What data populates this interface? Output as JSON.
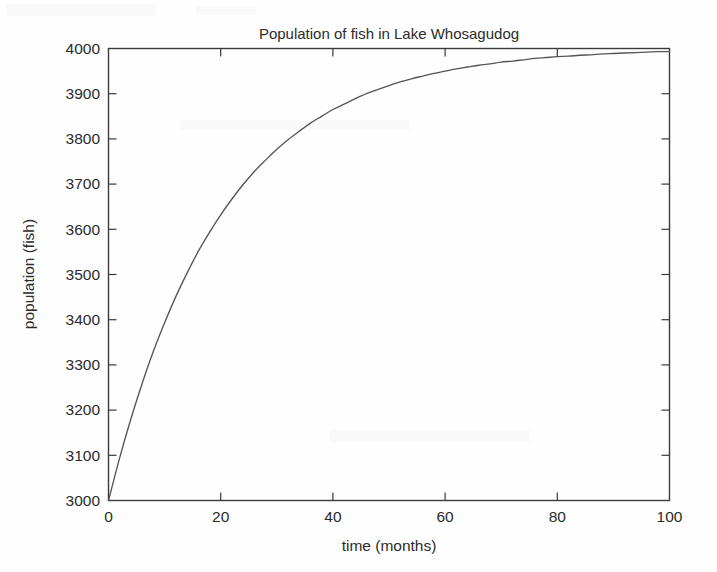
{
  "chart_data": {
    "type": "line",
    "title": "Population of fish in Lake Whosagudog",
    "xlabel": "time (months)",
    "ylabel": "population (fish)",
    "xlim": [
      0,
      100
    ],
    "ylim": [
      3000,
      4000
    ],
    "xticks": [
      0,
      20,
      40,
      60,
      80,
      100
    ],
    "xtick_labels": [
      "0",
      "20",
      "40",
      "60",
      "80",
      "100"
    ],
    "yticks": [
      3000,
      3100,
      3200,
      3300,
      3400,
      3500,
      3600,
      3700,
      3800,
      3900,
      4000
    ],
    "ytick_labels": [
      "3000",
      "3100",
      "3200",
      "3300",
      "3400",
      "3500",
      "3600",
      "3700",
      "3800",
      "3900",
      "4000"
    ],
    "grid": false,
    "legend": null,
    "series": [
      {
        "name": "population",
        "color": "#555555",
        "x": [
          0,
          2,
          4,
          6,
          8,
          10,
          12,
          14,
          16,
          18,
          20,
          22,
          24,
          26,
          28,
          30,
          32,
          34,
          36,
          38,
          40,
          42,
          44,
          46,
          48,
          50,
          52,
          54,
          56,
          58,
          60,
          62,
          64,
          66,
          68,
          70,
          72,
          74,
          76,
          78,
          80,
          82,
          84,
          86,
          88,
          90,
          92,
          94,
          96,
          98,
          100
        ],
        "values": [
          3000,
          3095,
          3181,
          3259,
          3330,
          3393,
          3451,
          3503,
          3551,
          3593,
          3632,
          3667,
          3699,
          3728,
          3753,
          3777,
          3798,
          3817,
          3835,
          3850,
          3865,
          3877,
          3889,
          3900,
          3909,
          3918,
          3926,
          3933,
          3939,
          3945,
          3950,
          3955,
          3959,
          3963,
          3966,
          3970,
          3972,
          3975,
          3978,
          3980,
          3982,
          3983,
          3985,
          3986,
          3988,
          3989,
          3990,
          3991,
          3992,
          3993,
          3993
        ]
      }
    ]
  },
  "figure": {
    "background_color": "#fefefe",
    "axis_color": "#3a3a3a",
    "text_color": "#2b2b2b"
  }
}
